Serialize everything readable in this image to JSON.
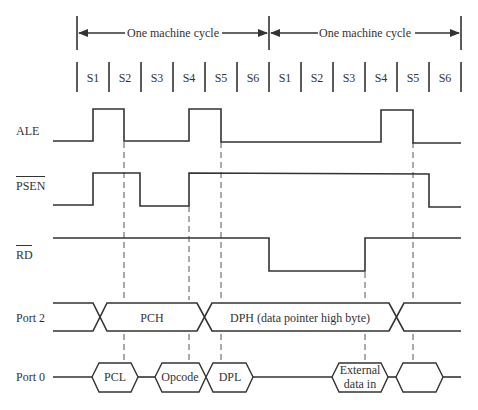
{
  "diagram": {
    "cycle_label_1": "One machine cycle",
    "cycle_label_2": "One machine cycle",
    "states": [
      "S1",
      "S2",
      "S3",
      "S4",
      "S5",
      "S6",
      "S1",
      "S2",
      "S3",
      "S4",
      "S5",
      "S6"
    ],
    "signals": {
      "ale": "ALE",
      "psen": "PSEN",
      "rd": "RD",
      "port2": "Port 2",
      "port0": "Port 0"
    },
    "port2_segments": {
      "pch": "PCH",
      "dph": "DPH (data pointer high byte)"
    },
    "port0_segments": {
      "pcl": "PCL",
      "opcode": "Opcode",
      "dpl": "DPL",
      "ext_line1": "External",
      "ext_line2": "data in"
    },
    "notes": {
      "psen_active_low": true,
      "rd_active_low": true
    }
  }
}
